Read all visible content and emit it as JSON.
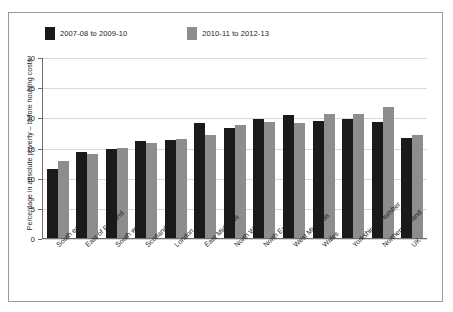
{
  "chart_data": {
    "type": "bar",
    "title": "",
    "xlabel": "",
    "ylabel": "Percentage in absolute poverty – before housing costs",
    "ylim": [
      0,
      30
    ],
    "yticks": [
      0,
      5,
      10,
      15,
      20,
      25,
      30
    ],
    "grid": true,
    "legend_position": "top-left",
    "categories": [
      "South east",
      "East of England",
      "South west",
      "Scotland",
      "London",
      "East Midlands",
      "North West",
      "North East",
      "West Midlands",
      "Wales",
      "Yorkshire & Humber",
      "Northern Ireland",
      "UK"
    ],
    "series": [
      {
        "name": "2007-08 to 2009-10",
        "color": "#1a1a1a",
        "values": [
          11.4,
          14.2,
          14.7,
          16.0,
          16.2,
          19.0,
          18.3,
          19.7,
          20.4,
          19.4,
          19.8,
          19.2,
          16.6
        ]
      },
      {
        "name": "2010-11 to 2012-13",
        "color": "#8d8d8d",
        "values": [
          12.8,
          13.9,
          15.0,
          15.8,
          16.4,
          17.1,
          18.7,
          19.3,
          19.1,
          20.6,
          20.5,
          21.7,
          17.0
        ]
      }
    ]
  },
  "legend": {
    "items": [
      {
        "label": "2007-08 to 2009-10",
        "color": "#1a1a1a"
      },
      {
        "label": "2010-11 to 2012-13",
        "color": "#8d8d8d"
      }
    ]
  },
  "axis": {
    "y_title": "Percentage in absolute poverty – before housing costs",
    "y_labels": [
      "0",
      "5",
      "10",
      "15",
      "20",
      "25",
      "30"
    ]
  }
}
